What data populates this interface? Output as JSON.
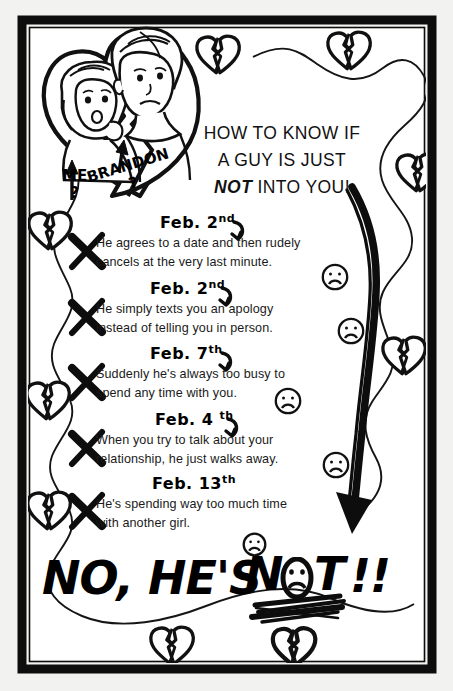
{
  "poster": {
    "title_lines": [
      "HOW TO KNOW IF",
      "A GUY IS JUST",
      "INTO YOU!"
    ],
    "title_emphasis": "NOT",
    "background_color": "#f2f2f0",
    "ink_color": "#000000",
    "frame_color": "#000000"
  },
  "photo": {
    "caption_me": "ME",
    "caption_me_mark": "?",
    "caption_brandon": "BRANDON",
    "caption_brandon_mark": "?",
    "arrow_me": "up-arrow",
    "arrow_brandon": "up-arrow"
  },
  "signs": [
    {
      "mark": "X",
      "date": "Feb. 2",
      "date_suffix": "nd",
      "lines": [
        "He agrees to a date and then rudely",
        "cancels at the very last minute."
      ],
      "emoji": "sad-face"
    },
    {
      "mark": "X",
      "date": "Feb. 2",
      "date_suffix": "nd",
      "lines": [
        "He simply texts you an apology",
        "instead of telling you in person."
      ],
      "emoji": "sad-face"
    },
    {
      "mark": "X",
      "date": "Feb. 7",
      "date_suffix": "th",
      "lines": [
        "Suddenly he's always too busy to",
        "spend any time with you."
      ],
      "emoji": "sad-face"
    },
    {
      "mark": "X",
      "date": "Feb. 4 ",
      "date_suffix": "th",
      "lines": [
        "When you try to talk about your",
        "relationship, he just walks away."
      ],
      "emoji": "sad-face"
    },
    {
      "mark": "X",
      "date": "Feb. 13",
      "date_suffix": "th",
      "lines": [
        "He's spending way too much time",
        "with another girl."
      ],
      "emoji": "sad-face"
    }
  ],
  "conclusion": {
    "part1": "NO, HE'S",
    "part2": "N",
    "part3": "T",
    "part4": "!!",
    "full_text": "NO, HE'S NOT!!",
    "underline": "scribble-underline",
    "o_is_sad_face": true
  },
  "decorations": {
    "big_arrow": "curved-down-arrow",
    "broken_hearts_count": 8,
    "vine": "wavy-line"
  }
}
